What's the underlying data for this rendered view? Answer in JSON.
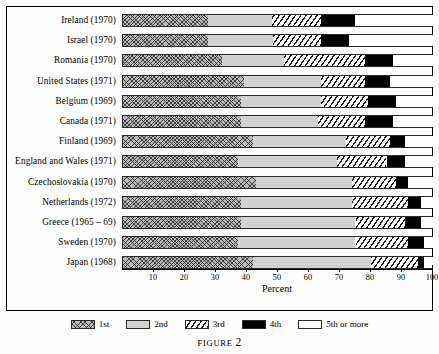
{
  "caption": {
    "prefix": "FIGURE",
    "number": "2"
  },
  "axis": {
    "title": "Percent",
    "ticks": [
      10,
      20,
      30,
      40,
      50,
      60,
      70,
      80,
      90,
      100
    ],
    "min": 0,
    "max": 100
  },
  "legend": {
    "items": [
      {
        "label": "1st",
        "fill": "cross-hatch-grey",
        "color": "#b9b9b9"
      },
      {
        "label": "2nd",
        "fill": "solid-light-grey",
        "color": "#d2d2d2"
      },
      {
        "label": "3rd",
        "fill": "diagonal-stripes",
        "color": "#ffffff"
      },
      {
        "label": "4th",
        "fill": "solid-black",
        "color": "#000000"
      },
      {
        "label": "5th or more",
        "fill": "solid-white",
        "color": "#ffffff"
      }
    ]
  },
  "chart_data": {
    "type": "bar",
    "orientation": "horizontal",
    "stacked": true,
    "stacked_percent": true,
    "title": "",
    "xlabel": "Percent",
    "ylabel": "",
    "xlim": [
      0,
      100
    ],
    "grid": false,
    "legend_position": "bottom",
    "series": [
      {
        "name": "1st",
        "values": [
          27.5,
          27.5,
          32.0,
          39.0,
          38.0,
          38.0,
          42.0,
          37.0,
          43.0,
          38.0,
          38.0,
          37.0,
          42.0
        ]
      },
      {
        "name": "2nd",
        "values": [
          20.5,
          21.0,
          20.0,
          25.0,
          26.0,
          25.0,
          30.0,
          32.0,
          31.0,
          36.0,
          37.0,
          38.0,
          38.0
        ]
      },
      {
        "name": "3rd",
        "values": [
          16.0,
          15.5,
          26.0,
          14.0,
          15.0,
          15.0,
          14.0,
          16.0,
          14.0,
          18.0,
          16.0,
          17.0,
          15.0
        ]
      },
      {
        "name": "4th",
        "values": [
          11.0,
          9.0,
          9.0,
          8.0,
          9.0,
          9.0,
          5.0,
          6.0,
          4.0,
          4.0,
          5.0,
          5.0,
          2.0
        ]
      },
      {
        "name": "5th or more",
        "values": [
          25.0,
          27.0,
          13.0,
          14.0,
          12.0,
          13.0,
          9.0,
          9.0,
          8.0,
          4.0,
          4.0,
          3.0,
          3.0
        ]
      }
    ],
    "categories": [
      "Ireland (1970)",
      "Israel (1970)",
      "Romania (1970)",
      "United States (1971)",
      "Belgium (1969)",
      "Canada (1971)",
      "Finland (1969)",
      "England and Wales (1971)",
      "Czechoslovakia (1970)",
      "Netherlands (1972)",
      "Greece (1965 – 69)",
      "Sweden (1970)",
      "Japan (1968)"
    ],
    "cumulative_boundaries": [
      [
        27.5,
        48.0,
        64.0,
        75.0
      ],
      [
        27.5,
        48.5,
        64.0,
        73.0
      ],
      [
        32.0,
        52.0,
        78.0,
        87.0
      ],
      [
        39.0,
        64.0,
        78.0,
        86.0
      ],
      [
        38.0,
        64.0,
        79.0,
        88.0
      ],
      [
        38.0,
        63.0,
        78.0,
        87.0
      ],
      [
        42.0,
        72.0,
        86.0,
        91.0
      ],
      [
        37.0,
        69.0,
        85.0,
        91.0
      ],
      [
        43.0,
        74.0,
        88.0,
        92.0
      ],
      [
        38.0,
        74.0,
        92.0,
        96.0
      ],
      [
        38.0,
        75.0,
        91.0,
        96.0
      ],
      [
        37.0,
        75.0,
        92.0,
        97.0
      ],
      [
        42.0,
        80.0,
        95.0,
        97.0
      ]
    ]
  }
}
